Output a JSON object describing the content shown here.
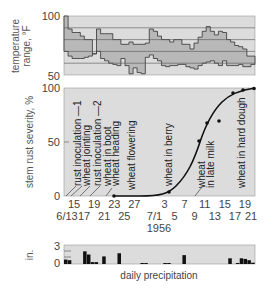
{
  "chart_data": [
    {
      "type": "area",
      "title": "",
      "ylabel": "temperature range, °F",
      "ylim": [
        50,
        100
      ],
      "yticks": [
        "100",
        "50"
      ],
      "gridlines_y": [
        90,
        80,
        70,
        60
      ],
      "x_start": "6/13",
      "x_end": "7/21",
      "series": [
        {
          "name": "daily max temperature",
          "values": [
            100,
            89,
            86,
            86,
            83,
            80,
            80,
            68,
            89,
            85,
            85,
            85,
            80,
            80,
            76,
            76,
            78,
            76,
            76,
            76,
            77,
            89,
            87,
            83,
            80,
            80,
            78,
            80,
            80,
            76,
            76,
            72,
            77,
            82,
            87,
            91,
            87,
            84,
            87,
            86,
            80,
            78,
            75,
            74,
            72,
            66,
            66
          ]
        },
        {
          "name": "daily min temperature",
          "values": [
            70,
            66,
            64,
            64,
            64,
            65,
            66,
            68,
            70,
            64,
            62,
            60,
            59,
            58,
            64,
            58,
            51,
            56,
            52,
            51,
            65,
            67,
            64,
            62,
            58,
            57,
            58,
            58,
            59,
            59,
            57,
            56,
            55,
            58,
            60,
            61,
            62,
            60,
            58,
            62,
            58,
            58,
            58,
            59,
            57,
            57,
            59
          ]
        }
      ]
    },
    {
      "type": "line",
      "title": "",
      "xlabel": "1956",
      "ylabel": "stem rust severity, %",
      "ylim": [
        0,
        100
      ],
      "yticks": [
        "0",
        "50",
        "100"
      ],
      "xticks_top": [
        "15",
        "19",
        "23",
        "27",
        "3",
        "7",
        "11",
        "15",
        "19"
      ],
      "xticks_bottom": [
        "6/13",
        "17",
        "21",
        "25",
        "7/1",
        "5",
        "9",
        "13",
        "17",
        "21"
      ],
      "points": [
        {
          "date": "6/23",
          "value": 0
        },
        {
          "date": "7/4",
          "value": 3
        },
        {
          "date": "7/10",
          "value": 51
        },
        {
          "date": "7/11",
          "value": 68
        },
        {
          "date": "7/14",
          "value": 70
        },
        {
          "date": "7/17",
          "value": 95
        },
        {
          "date": "7/19",
          "value": 97
        },
        {
          "date": "7/21",
          "value": 99
        }
      ],
      "annotations": [
        {
          "label": "rust inoculation —1",
          "date": "6/14"
        },
        {
          "label": "wheat jointing",
          "date": "6/16"
        },
        {
          "label": "rust inoculation —2",
          "date": "6/18"
        },
        {
          "label": "wheat in boot",
          "date": "6/21"
        },
        {
          "label": "wheat heading",
          "date": "6/22"
        },
        {
          "label": "wheat flowering",
          "date": "6/26"
        },
        {
          "label": "wheat in berry",
          "date": "7/3"
        },
        {
          "label": "wheat in late milk",
          "date": "7/9"
        },
        {
          "label": "wheat in hard dough",
          "date": "7/19"
        }
      ]
    },
    {
      "type": "bar",
      "title": "daily precipitation",
      "ylabel": "in.",
      "ylim": [
        0,
        3
      ],
      "yticks": [
        "3",
        "0"
      ],
      "x_start": "6/13",
      "x_end": "7/21",
      "categories": [
        "6/13",
        "6/14",
        "6/15",
        "6/16",
        "6/17",
        "6/18",
        "6/19",
        "6/20",
        "6/21",
        "6/22",
        "6/23",
        "6/24",
        "6/25",
        "6/26",
        "6/27",
        "6/28",
        "6/29",
        "6/30",
        "7/1",
        "7/2",
        "7/3",
        "7/4",
        "7/5",
        "7/6",
        "7/7",
        "7/8",
        "7/9",
        "7/10",
        "7/11",
        "7/12",
        "7/13",
        "7/14",
        "7/15",
        "7/16",
        "7/17",
        "7/18",
        "7/19",
        "7/20"
      ],
      "values": [
        0.7,
        0.6,
        0,
        0,
        0,
        2.0,
        1.5,
        0.3,
        0.3,
        0,
        1.2,
        0,
        0,
        0,
        1.7,
        0,
        0,
        0,
        0,
        0,
        0.1,
        0.1,
        0,
        0,
        0,
        0,
        0.1,
        0.1,
        0,
        0,
        0,
        1.4,
        0,
        0,
        0,
        0,
        0,
        0,
        0,
        0,
        0,
        0,
        0,
        0.9,
        0,
        0.1,
        0.9,
        0.8,
        0.6,
        0.2
      ]
    }
  ],
  "labels": {
    "temp_ylabel_1": "temperature",
    "temp_ylabel_2": "range, °F",
    "temp_y100": "100",
    "temp_y50": "50",
    "rust_ylabel": "stem rust severity, %",
    "rust_y100": "100",
    "rust_y50": "50",
    "rust_y0": "0",
    "year": "1956",
    "precip_ylabel": "in.",
    "precip_y3": "3",
    "precip_y0": "0",
    "precip_caption": "daily precipitation",
    "xticks_top": [
      "15",
      "19",
      "23",
      "27",
      "3",
      "7",
      "11",
      "15",
      "19"
    ],
    "xticks_bottom": [
      "6/13",
      "17",
      "21",
      "25",
      "7/1",
      "5",
      "9",
      "13",
      "17",
      "21"
    ],
    "ann": {
      "a1": "rust inoculation —1",
      "a2": "wheat jointing",
      "a3": "rust inoculation —2",
      "a4": "wheat in boot",
      "a5": "wheat heading",
      "a6": "wheat flowering",
      "a7": "wheat in berry",
      "a8a": "wheat",
      "a8b": "in late milk",
      "a9": "wheat in hard dough"
    }
  },
  "colors": {
    "panel_bg": "#dcdcdc",
    "band_fill": "#b8b8b8",
    "line": "#222222",
    "grid": "#555555",
    "bar": "#111111"
  }
}
